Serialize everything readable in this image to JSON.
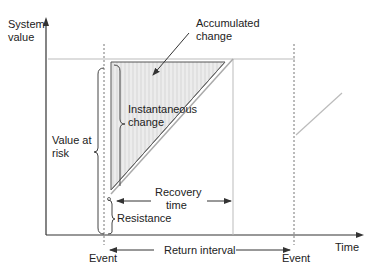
{
  "axes": {
    "y_label_line1": "System",
    "y_label_line2": "value",
    "x_label": "Time"
  },
  "labels": {
    "accumulated_line1": "Accumulated",
    "accumulated_line2": "change",
    "instantaneous_line1": "Instantaneous",
    "instantaneous_line2": "change",
    "value_at_risk_line1": "Value at",
    "value_at_risk_line2": "risk",
    "recovery_line1": "Recovery",
    "recovery_line2": "time",
    "resistance": "Resistance",
    "return_interval": "Return interval",
    "event_1": "Event",
    "event_2": "Event"
  },
  "colors": {
    "axis": "#333333",
    "shade": "#e6e6e6",
    "hatch": "#c8c8c8",
    "guide": "#aaaaaa",
    "text": "#222222"
  }
}
